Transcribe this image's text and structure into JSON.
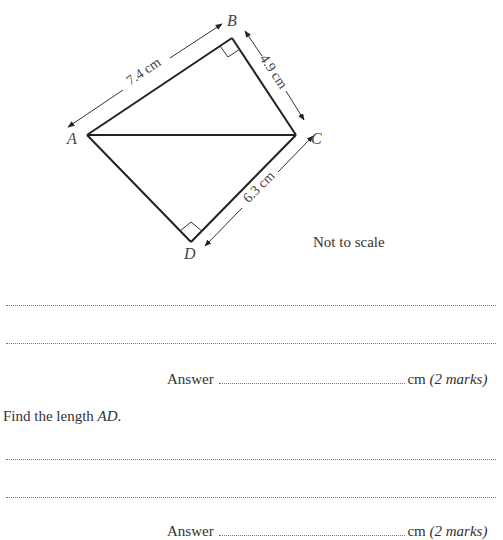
{
  "diagram": {
    "vertices": {
      "A": {
        "label": "A",
        "x": 87,
        "y": 135
      },
      "B": {
        "label": "B",
        "x": 232,
        "y": 38
      },
      "C": {
        "label": "C",
        "x": 296,
        "y": 135
      },
      "D": {
        "label": "D",
        "x": 191,
        "y": 242
      }
    },
    "lengths": {
      "AB": "7.4 cm",
      "BC": "4.9 cm",
      "CD": "6.3 cm"
    },
    "right_angles": [
      "B",
      "D"
    ],
    "note": "Not to scale"
  },
  "part_a": {
    "working_lines": 2,
    "answer_label": "Answer",
    "unit": "cm",
    "marks": "(2 marks)"
  },
  "part_b": {
    "question_prefix": "Find the length",
    "question_var": "AD",
    "question_suffix": ".",
    "working_lines": 2,
    "answer_label": "Answer",
    "unit": "cm",
    "marks": "(2 marks)"
  }
}
